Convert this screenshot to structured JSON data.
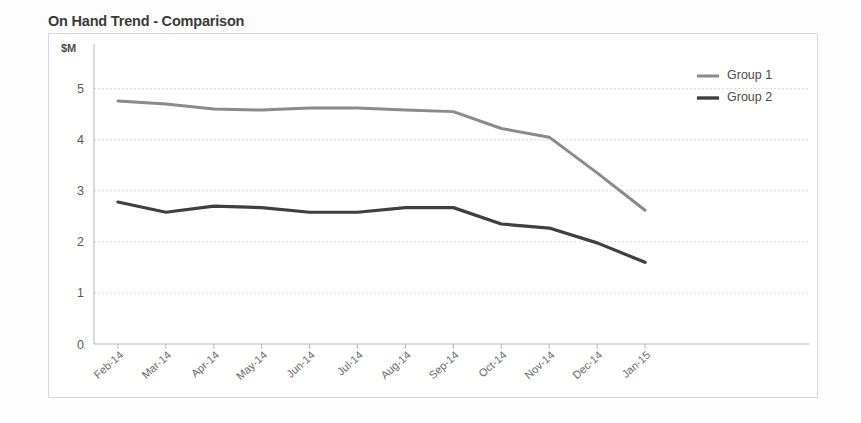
{
  "chart_data": {
    "type": "line",
    "title": "On Hand Trend - Comparison",
    "xlabel": "",
    "ylabel": "$M",
    "ylim": [
      0,
      5.6
    ],
    "yticks": [
      0,
      1,
      2,
      3,
      4,
      5
    ],
    "grid": true,
    "legend_position": "top-right",
    "categories": [
      "Feb-14",
      "Mar-14",
      "Apr-14",
      "May-14",
      "Jun-14",
      "Jul-14",
      "Aug-14",
      "Sep-14",
      "Oct-14",
      "Nov-14",
      "Dec-14",
      "Jan-15"
    ],
    "series": [
      {
        "name": "Group 1",
        "color": "#8a8a8a",
        "values": [
          4.76,
          4.7,
          4.6,
          4.58,
          4.62,
          4.62,
          4.58,
          4.55,
          4.22,
          4.05,
          3.35,
          2.62
        ]
      },
      {
        "name": "Group 2",
        "color": "#3f3f3f",
        "values": [
          2.78,
          2.58,
          2.7,
          2.67,
          2.58,
          2.58,
          2.67,
          2.67,
          2.35,
          2.27,
          1.98,
          1.6
        ]
      }
    ]
  },
  "colors": {
    "title_text": "#3a3a3a",
    "tick_text": "#5a5a5a",
    "gridline": "#d9d9d9",
    "axis_line": "#b5b5b5",
    "frame_border": "#d8d8d8",
    "card_background": "#fdfdfd",
    "plot_background": "#ffffff"
  }
}
